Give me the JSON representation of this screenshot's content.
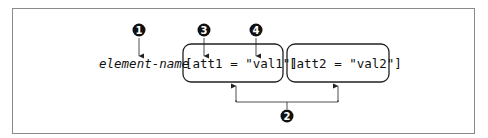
{
  "diagram": {
    "element_name": "element-name",
    "attributes": [
      {
        "text": "[att1 = \"val1\"]"
      },
      {
        "text": "[att2 = \"val2\"]"
      }
    ],
    "callouts": [
      {
        "number": "1",
        "target": "element-name"
      },
      {
        "number": "2",
        "target": "attribute-groups"
      },
      {
        "number": "3",
        "target": "attribute-name"
      },
      {
        "number": "4",
        "target": "attribute-value"
      }
    ]
  }
}
